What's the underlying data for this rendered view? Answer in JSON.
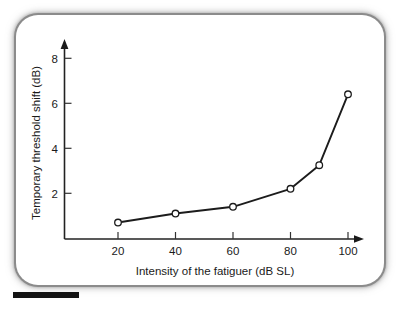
{
  "figure": {
    "frame_color": "#8b8b8b",
    "background": "#ffffff",
    "line_color": "#1c1c1c",
    "marker_fill": "#ffffff",
    "scale_bar_label": ""
  },
  "chart_data": {
    "type": "line",
    "title": "",
    "xlabel": "Intensity of the fatiguer (dB SL)",
    "ylabel": "Temporary threshold shift (dB)",
    "x": [
      20,
      40,
      60,
      80,
      90,
      100
    ],
    "values": [
      0.7,
      1.1,
      1.4,
      2.2,
      3.25,
      6.4
    ],
    "xlim": [
      0,
      110
    ],
    "ylim": [
      0,
      9
    ],
    "xticks": [
      20,
      40,
      60,
      80,
      100
    ],
    "xtick_labels": [
      "20",
      "40",
      "60",
      "80",
      "100"
    ],
    "yticks": [
      2,
      4,
      6,
      8
    ],
    "ytick_labels": [
      "2",
      "4",
      "6",
      "8"
    ],
    "grid": false,
    "legend": null,
    "marker": "open-circle",
    "series": [
      {
        "name": "Temporary threshold shift",
        "points": [
          {
            "x": 20,
            "y": 0.7
          },
          {
            "x": 40,
            "y": 1.1
          },
          {
            "x": 60,
            "y": 1.4
          },
          {
            "x": 80,
            "y": 2.2
          },
          {
            "x": 90,
            "y": 3.25
          },
          {
            "x": 100,
            "y": 6.4
          }
        ]
      }
    ]
  }
}
